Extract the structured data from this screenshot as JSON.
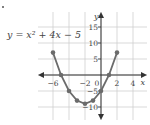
{
  "equation_label": "y = x² + 4x − 5",
  "chart_data": {
    "type": "line",
    "xlabel": "x",
    "ylabel": "y",
    "xlim": [
      -7.8,
      5.8
    ],
    "ylim": [
      -14,
      19
    ],
    "grid": true,
    "x_ticks": [
      -6,
      -2,
      0,
      2,
      4
    ],
    "x_tick_labels": [
      "−6",
      "−2",
      "0",
      "2",
      "4"
    ],
    "y_ticks": [
      15,
      10,
      5,
      -5,
      -10
    ],
    "y_tick_labels": [
      "15",
      "10",
      "5",
      "−5",
      "−10"
    ],
    "series": [
      {
        "name": "y = x^2 + 4x - 5",
        "x": [
          -6,
          -5,
          -4,
          -3,
          -2,
          -1,
          0,
          1,
          2
        ],
        "y": [
          7,
          0,
          -5,
          -8,
          -9,
          -8,
          -5,
          0,
          7
        ],
        "markers": true,
        "color": "#6b6b6b"
      }
    ],
    "colors": {
      "grid": "#cfcfcf",
      "axis": "#333333",
      "curve": "#6b6b6b",
      "text": "#444444"
    }
  }
}
